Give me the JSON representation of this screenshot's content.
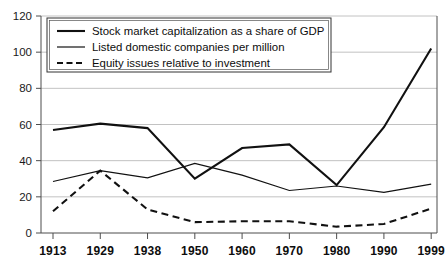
{
  "chart_data": {
    "type": "line",
    "title": "",
    "subtitle": "",
    "xlabel": "",
    "ylabel": "",
    "categories": [
      "1913",
      "1929",
      "1938",
      "1950",
      "1960",
      "1970",
      "1980",
      "1990",
      "1999"
    ],
    "ylim": [
      0,
      120
    ],
    "yticks": [
      0,
      20,
      40,
      60,
      80,
      100,
      120
    ],
    "ytick_labels": [
      "0",
      "20",
      "40",
      "60",
      "80",
      "100",
      "120"
    ],
    "grid": true,
    "grid_axis": "y",
    "legend_position": "top-left",
    "series": [
      {
        "name": "Stock market capitalization as a share of GDP",
        "style": "solid",
        "width": 2.1,
        "color": "#111111",
        "values": [
          57,
          60.5,
          58,
          30,
          47,
          49,
          26.5,
          58.5,
          102
        ]
      },
      {
        "name": "Listed domestic companies per million",
        "style": "solid",
        "width": 1.2,
        "color": "#111111",
        "values": [
          28.5,
          34.5,
          30.5,
          38.5,
          32,
          23.5,
          26,
          22.5,
          27
        ]
      },
      {
        "name": "Equity issues relative to investment",
        "style": "dashed",
        "width": 2.1,
        "color": "#111111",
        "values": [
          12,
          34.5,
          13,
          6,
          6.5,
          6.5,
          3.5,
          5,
          13.5
        ]
      }
    ]
  },
  "legend": {
    "items": [
      {
        "label": "Stock market capitalization as a share of GDP",
        "style": "solid",
        "width": 2.1
      },
      {
        "label": "Listed domestic companies per million",
        "style": "solid",
        "width": 1.2
      },
      {
        "label": "Equity issues relative to investment",
        "style": "dashed",
        "width": 2.1
      }
    ]
  },
  "colors": {
    "line": "#111111",
    "grid": "#b3b3b3",
    "axis": "#4d4d4d",
    "background": "#ffffff",
    "text": "#0d0d0d"
  }
}
